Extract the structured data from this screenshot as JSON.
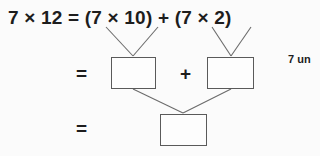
{
  "worksheet": {
    "top_equation": "7 × 12 = (7 × 10) + (7 × 2)",
    "equals_row2": "=",
    "plus_sign": "+",
    "equals_row3": "=",
    "boxes": [
      {
        "id": "box-tens",
        "value": "",
        "label": "tens-product-answer-box"
      },
      {
        "id": "box-ones",
        "value": "",
        "label": "ones-product-answer-box"
      },
      {
        "id": "box-total",
        "value": "",
        "label": "total-product-answer-box"
      }
    ],
    "side_note": "7 un",
    "colors": {
      "background": "#fbfbfb",
      "text": "#1d1d1d",
      "box_border": "#5a5a5a",
      "connector_line": "#6b6b6b"
    }
  }
}
